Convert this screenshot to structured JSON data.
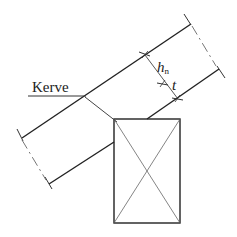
{
  "diagram": {
    "labels": {
      "kerve": "Kerve",
      "h": "h",
      "h_sub": "n",
      "t": "t"
    },
    "elements": [
      {
        "id": "rafter-top-edge",
        "type": "line",
        "desc": "upper edge of inclined rafter"
      },
      {
        "id": "rafter-bottom-edge",
        "type": "line",
        "desc": "lower edge of inclined rafter (interrupted by post)"
      },
      {
        "id": "rafter-end-lines",
        "type": "dash-dot",
        "desc": "break/center lines at both rafter ends"
      },
      {
        "id": "post",
        "type": "rectangle-with-cross",
        "desc": "post/support section"
      },
      {
        "id": "notch-line",
        "type": "line",
        "desc": "kerve cut from top edge to post corner"
      },
      {
        "id": "dimension-hn",
        "type": "dimension",
        "desc": "remaining height h_n"
      },
      {
        "id": "dimension-t",
        "type": "dimension",
        "desc": "notch depth t"
      }
    ],
    "colors": {
      "line": "#222222",
      "thin_line": "#555555",
      "background": "#ffffff"
    }
  }
}
